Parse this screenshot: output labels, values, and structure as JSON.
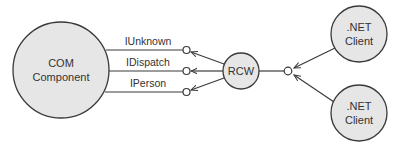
{
  "diagram": {
    "nodes": {
      "com_component": {
        "line1": "COM",
        "line2": "Component"
      },
      "rcw": {
        "label": "RCW"
      },
      "client_top": {
        "line1": ".NET",
        "line2": "Client"
      },
      "client_bottom": {
        "line1": ".NET",
        "line2": "Client"
      }
    },
    "interfaces": [
      {
        "label": "IUnknown"
      },
      {
        "label": "IDispatch"
      },
      {
        "label": "IPerson"
      }
    ],
    "colors": {
      "node_fill": "#e6e6e6",
      "stroke": "#3a3a3a",
      "text": "#333333",
      "background": "#ffffff"
    }
  }
}
